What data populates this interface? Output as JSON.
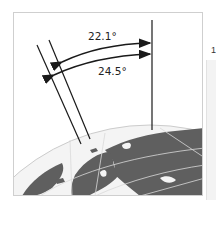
{
  "diagram": {
    "type": "refraction-angle-diagram",
    "labels": {
      "angle_inner": "22.1°",
      "angle_outer": "24.5°"
    },
    "elements": {
      "vertical_reference_line": "zenith / vertical line",
      "ray_lines": 2,
      "arrows": 2,
      "globe": "Earth globe (Northern Europe / Russia) with latitude-longitude grid"
    },
    "colors": {
      "land": "#5f5f5f",
      "ocean": "#f4f4f4",
      "grid": "#d9d9d9",
      "lines": "#1a1a1a",
      "frame": "#cfcfcf"
    }
  },
  "side": {
    "glyph": "1"
  }
}
